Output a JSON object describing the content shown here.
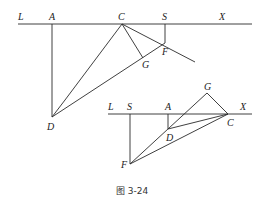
{
  "caption": "图 3-24",
  "figure_top": {
    "labels": {
      "L": "L",
      "A": "A",
      "C": "C",
      "S": "S",
      "X": "X",
      "F": "F",
      "G": "G",
      "D": "D"
    }
  },
  "figure_bottom": {
    "labels": {
      "L": "L",
      "S": "S",
      "A": "A",
      "G": "G",
      "X": "X",
      "D": "D",
      "C": "C",
      "F": "F"
    }
  },
  "colors": {
    "line": "#2a2a2a",
    "text": "#222222"
  }
}
